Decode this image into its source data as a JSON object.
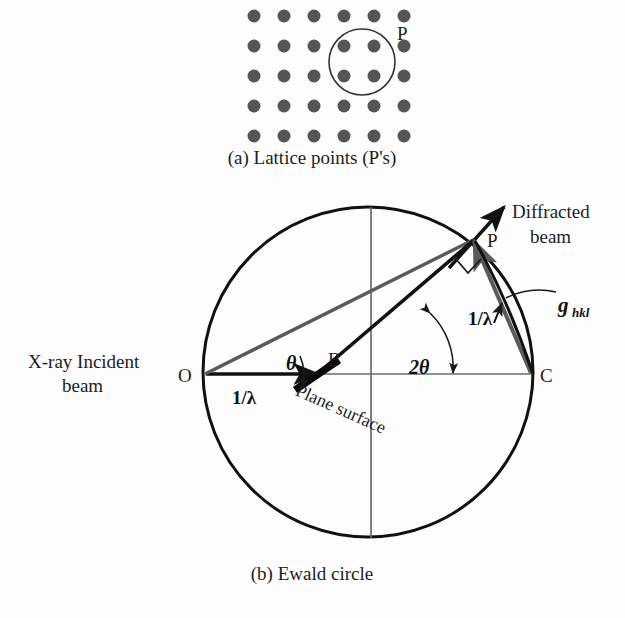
{
  "figure": {
    "panel_a": {
      "caption": "(a) Lattice points (P's)",
      "point_label": "P",
      "lattice": {
        "rows": 5,
        "cols": 6,
        "x_start": 254,
        "y_start": 16,
        "x_step": 30,
        "y_step": 30,
        "dot_radius": 6.5,
        "dot_color": "#555555"
      },
      "circle": {
        "cx": 362,
        "cy": 62,
        "r": 33,
        "stroke": "#333333"
      }
    },
    "panel_b": {
      "caption": "(b) Ewald circle",
      "ewald_circle": {
        "cx": 368,
        "cy": 372,
        "r": 165,
        "stroke": "#111111"
      },
      "points": {
        "O": {
          "label": "O",
          "x": 204,
          "y": 374
        },
        "B": {
          "label": "B",
          "x": 314,
          "y": 374
        },
        "C": {
          "label": "C",
          "x": 532,
          "y": 374
        },
        "P": {
          "label": "P",
          "x": 473,
          "y": 239
        }
      },
      "labels": {
        "incident_beam": "X-ray Incident\nbeam",
        "incident_beam_line1": "X-ray Incident",
        "incident_beam_line2": "beam",
        "diffracted_beam_line1": "Diffracted",
        "diffracted_beam_line2": "beam",
        "plane_surface": "Plane surface",
        "theta": "θ",
        "two_theta": "2θ",
        "inv_lambda_incident": "1/λ",
        "inv_lambda_diffracted": "1/λ",
        "g_vector": "g",
        "g_subscript": "hkl"
      },
      "colors": {
        "circle_stroke": "#111111",
        "arrow_black": "#111111",
        "ray_gray": "#5a5a5a",
        "axis_gray": "#6b6b6b",
        "plane_bar": "#080808"
      }
    }
  }
}
